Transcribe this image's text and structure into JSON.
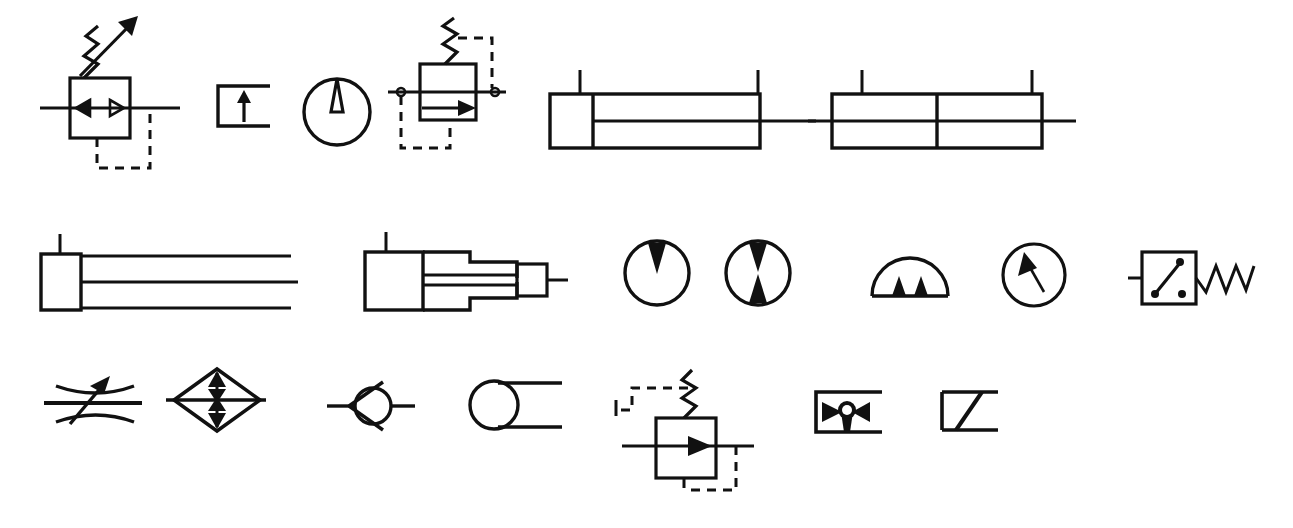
{
  "sheet": {
    "title": "Hydraulic and Pneumatic Schematic Symbols",
    "background_color": "#ffffff",
    "ink_color": "#111111",
    "width": 1293,
    "height": 528,
    "rows": 3
  },
  "symbols": [
    {
      "id": "pressure-relief-valve-adjustable",
      "name": "Adjustable pressure relief valve",
      "row": 1,
      "order": 1,
      "features": "square valve body, two opposing arrowheads, adjustable spring with diagonal arrow, dashed pilot line"
    },
    {
      "id": "filter-with-arrow",
      "name": "Open bracket with up arrow",
      "row": 1,
      "order": 2,
      "features": "three-sided rectangle open at left, solid upward arrow inside"
    },
    {
      "id": "gauge-pointer-up",
      "name": "Circular gauge with vertical pointer",
      "row": 1,
      "order": 3,
      "features": "circle with hollow tapered needle pointing up from center"
    },
    {
      "id": "pressure-reducing-valve-piloted",
      "name": "Piloted pressure reducing valve",
      "row": 1,
      "order": 4,
      "features": "square body with right-pointing solid arrow, spring on top, dashed pilot lines both sides, port dots"
    },
    {
      "id": "double-acting-cylinder",
      "name": "Double acting cylinder",
      "row": 1,
      "order": 5,
      "features": "long rectangle barrel, end cap at left, piston rod extending right, two port stems on top"
    },
    {
      "id": "double-rod-cylinder",
      "name": "Double rod end cylinder",
      "row": 1,
      "order": 6,
      "features": "rectangle barrel with center divider, rod through both ends, two port stems on top"
    },
    {
      "id": "single-acting-cylinder-open",
      "name": "Single acting cylinder (open end)",
      "row": 2,
      "order": 1,
      "features": "end cap box at left, three long horizontal lines extending right, one port stem on top"
    },
    {
      "id": "telescoping-cylinder",
      "name": "Telescoping cylinder",
      "row": 2,
      "order": 2,
      "features": "stepped nested rectangles decreasing in size with rod out right, one port stem on top"
    },
    {
      "id": "pump-unidirectional",
      "name": "Unidirectional pump",
      "row": 2,
      "order": 3,
      "features": "circle with one solid triangle pointing inward from top"
    },
    {
      "id": "pump-bidirectional",
      "name": "Bidirectional pump",
      "row": 2,
      "order": 4,
      "features": "circle with two solid triangles pointing inward from top and bottom"
    },
    {
      "id": "pump-half-circle-dual",
      "name": "Half circle pump with two triangles",
      "row": 2,
      "order": 5,
      "features": "semicircle sitting on baseline with two small solid triangles inside"
    },
    {
      "id": "pressure-gauge-needle",
      "name": "Pressure gauge with diagonal needle",
      "row": 2,
      "order": 6,
      "features": "circle with solid arrowhead needle pointing up-left"
    },
    {
      "id": "pressure-switch-spring",
      "name": "Pressure switch with spring",
      "row": 2,
      "order": 7,
      "features": "square with internal hinged contact and two terminal dots, zigzag spring to right, lead to left"
    },
    {
      "id": "adjustable-restrictor",
      "name": "Adjustable restrictor / needle valve",
      "row": 3,
      "order": 1,
      "features": "horizontal flow line crossed by two opposing curved arcs, solid diagonal arrow"
    },
    {
      "id": "check-valve-bridge",
      "name": "Check valve bridge (diamond)",
      "row": 3,
      "order": 2,
      "features": "diamond outline, horizontal line through, vertical line with four solid arrowheads"
    },
    {
      "id": "check-valve-ball-seat",
      "name": "Check valve with ball and seat",
      "row": 3,
      "order": 3,
      "features": "circle with V seat opening left, horizontal port lines both sides"
    },
    {
      "id": "accumulator-circle",
      "name": "Circle with parallel lines",
      "row": 3,
      "order": 4,
      "features": "circle with two horizontal lines tangent from right side"
    },
    {
      "id": "sequence-valve-piloted",
      "name": "Piloted sequence valve",
      "row": 3,
      "order": 5,
      "features": "square body with right-pointing solid arrow, spring on top, dashed pilot lines, drain line"
    },
    {
      "id": "shuttle-valve",
      "name": "Shuttle valve / quick exhaust",
      "row": 3,
      "order": 6,
      "features": "bracket box with two solid triangles flanking a small circle, solid column below"
    },
    {
      "id": "flow-path-box-diagonal",
      "name": "Box with diagonal flow path",
      "row": 3,
      "order": 7,
      "features": "open rectangle with a bold diagonal line from bottom-left to top-right"
    }
  ]
}
